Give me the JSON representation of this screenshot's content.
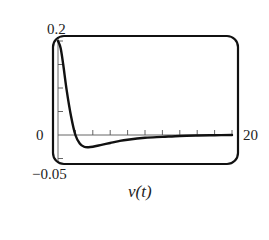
{
  "chart_data": {
    "type": "line",
    "title": "v(t)",
    "xlabel": "",
    "ylabel": "",
    "xlim": [
      0,
      20
    ],
    "ylim": [
      -0.05,
      0.2
    ],
    "x_tick_step": 2,
    "y_tick_step": 0.05,
    "grid": false,
    "legend": null,
    "labels": {
      "y_max": "0.2",
      "y_zero": "0",
      "y_min": "−0.05",
      "x_max": "20",
      "caption": "v(t)"
    },
    "series": [
      {
        "name": "v(t)",
        "x": [
          0,
          0.3,
          0.6,
          1.0,
          1.5,
          2.0,
          2.5,
          3.0,
          3.5,
          4.0,
          5.0,
          6.0,
          7.0,
          8.0,
          10.0,
          12.0,
          14.0,
          16.0,
          18.0,
          20.0
        ],
        "y": [
          0.2,
          0.185,
          0.15,
          0.095,
          0.04,
          0.0,
          -0.018,
          -0.025,
          -0.026,
          -0.025,
          -0.021,
          -0.017,
          -0.013,
          -0.01,
          -0.006,
          -0.004,
          -0.002,
          -0.001,
          -0.0005,
          0.0
        ]
      }
    ]
  }
}
